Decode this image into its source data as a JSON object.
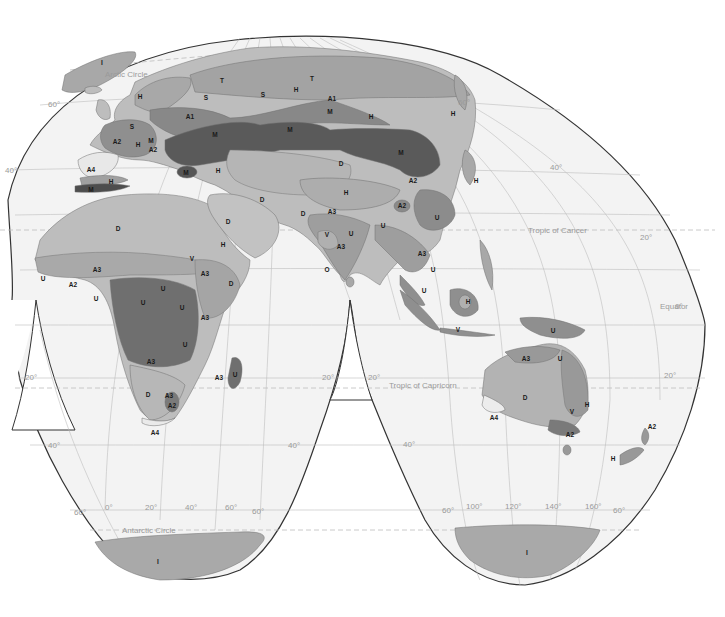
{
  "map": {
    "projection": "interrupted homolosine (world, Eastern Hemisphere lobes)",
    "colors": {
      "ocean": "#f3f3f3",
      "land_light": "#bcbcbc",
      "land_mid": "#a5a5a5",
      "land_dark": "#8a8a8a",
      "mountain_dark": "#555555",
      "ice": "#9e9e9e",
      "border": "#333333",
      "grid": "#bdbdbd",
      "grid_label": "#9a9a9a"
    },
    "reference_lines": {
      "arctic_circle": "Arctic Circle",
      "tropic_cancer": "Tropic of Cancer",
      "equator": "Equator",
      "tropic_capricorn": "Tropic of Capricorn",
      "antarctic_circle": "Antarctic Circle"
    },
    "latitude_labels": {
      "n60_left": "60°",
      "n40_left": "40°",
      "n60_right": "60°",
      "n40_right": "40°",
      "n20_right": "20°",
      "eq_right": "0°",
      "s20_left": "20°",
      "s20_mid_l": "20°",
      "s20_mid_r": "20°",
      "s20_right": "20°",
      "s40_left": "40°",
      "s40_mid_l": "40°",
      "s40_mid_r": "40°",
      "s60_left": "60°",
      "s60_mid_l": "60°",
      "s60_mid_r": "60°",
      "s60_right": "60°"
    },
    "longitude_labels": {
      "lon0": "0°",
      "lon20": "20°",
      "lon40": "40°",
      "lon60": "60°",
      "lon100": "100°",
      "lon120": "120°",
      "lon140": "140°",
      "lon160": "160°"
    },
    "regions": {
      "greenland_I": "I",
      "scand_H": "H",
      "russia_T": "T",
      "russia_S1": "S",
      "russia_S2": "S",
      "siberia_T": "T",
      "siberia_H": "H",
      "siberia_A1": "A1",
      "siberia_M1": "M",
      "siberia_H2": "H",
      "kamchatka_H": "H",
      "japan_H": "H",
      "europe_A1": "A1",
      "europe_S": "S",
      "france_A2": "A2",
      "alps_M": "M",
      "alps_H": "H",
      "alps_A2": "A2",
      "caucasus_M": "M",
      "central_asia_M": "M",
      "mongolia_M": "M",
      "iberia_A4": "A4",
      "atlas_H": "H",
      "atlas_M": "M",
      "anatolia_M": "M",
      "iran_H": "H",
      "kazakh_D": "D",
      "iran_D": "D",
      "tibet_H": "H",
      "china_A2_1": "A2",
      "china_A2_2": "A2",
      "china_U": "U",
      "sahara_D": "D",
      "arabia_D": "D",
      "arabia_H": "H",
      "pakistan_D": "D",
      "india_A3": "A3",
      "india_V": "V",
      "india_U": "U",
      "india_A3b": "A3",
      "india_O": "O",
      "burma_U": "U",
      "indochina_A3": "A3",
      "indochina_U": "U",
      "malaya_U": "U",
      "borneo_H": "H",
      "java_V": "V",
      "png_U": "U",
      "sahel_A3": "A3",
      "wafrica_U": "U",
      "wafrica_A2": "A2",
      "nigeria_U": "U",
      "ethiopia_V": "V",
      "ethiopia_A3": "A3",
      "somalia_D": "D",
      "congo_U1": "U",
      "congo_U2": "U",
      "congo_U3": "U",
      "eafrica_A3": "A3",
      "zambia_U": "U",
      "angola_A3": "A3",
      "madagascar_A3": "A3",
      "madagascar_U": "U",
      "kalahari_D": "D",
      "safrica_A3": "A3",
      "safrica_A2": "A2",
      "cape_A4": "A4",
      "aus_A3": "A3",
      "aus_U": "U",
      "aus_D": "D",
      "aus_V": "V",
      "aus_H": "H",
      "aus_A4": "A4",
      "aus_A2": "A2",
      "nz_A2": "A2",
      "nz_H": "H",
      "antarctica_I1": "I",
      "antarctica_I2": "I"
    }
  }
}
